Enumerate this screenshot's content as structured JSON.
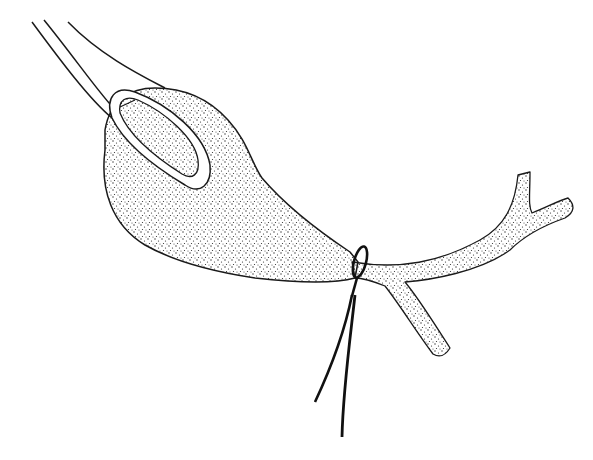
{
  "figure": {
    "type": "medical-line-illustration",
    "elements": [
      "forceps",
      "gallbladder",
      "ligature-suture",
      "cystic-duct",
      "common-bile-duct"
    ],
    "colors": {
      "ink": "#1a1a1a",
      "background": "#ffffff",
      "stipple": "#2a2a2a"
    }
  }
}
